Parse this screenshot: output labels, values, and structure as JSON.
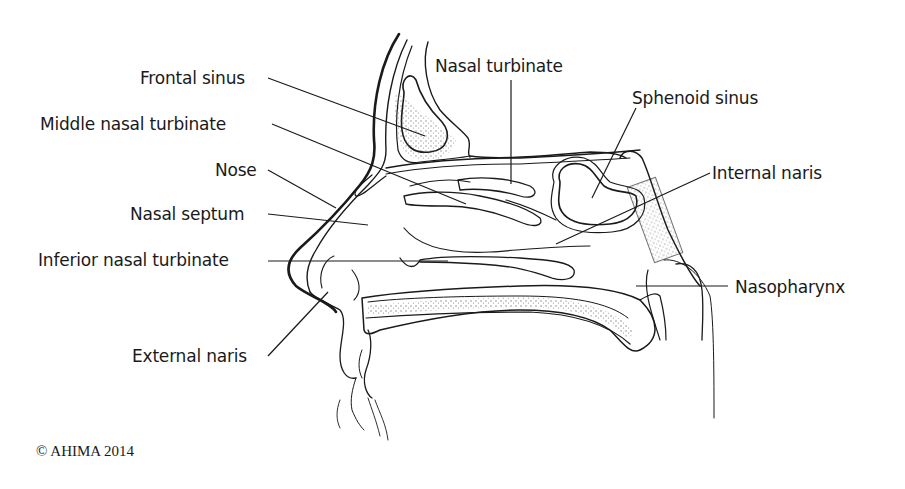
{
  "diagram": {
    "labels": {
      "frontal_sinus": "Frontal sinus",
      "middle_nasal_turbinate": "Middle nasal turbinate",
      "nose": "Nose",
      "nasal_septum": "Nasal septum",
      "inferior_nasal_turbinate": "Inferior nasal turbinate",
      "external_naris": "External naris",
      "nasal_turbinate": "Nasal turbinate",
      "sphenoid_sinus": "Sphenoid sinus",
      "internal_naris": "Internal naris",
      "nasopharynx": "Nasopharynx"
    },
    "copyright": "© AHIMA 2014",
    "colors": {
      "ink": "#1a1a1a",
      "background": "#ffffff",
      "stipple": "#555555"
    }
  }
}
